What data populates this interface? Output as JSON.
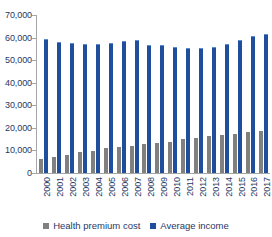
{
  "chart_data": {
    "type": "bar",
    "title": "",
    "subtitle": "",
    "xlabel": "",
    "ylabel": "",
    "ylim": [
      0,
      70000
    ],
    "yticks": [
      0,
      10000,
      20000,
      30000,
      40000,
      50000,
      60000,
      70000
    ],
    "ytick_labels": [
      "0",
      "10,000",
      "20,000",
      "30,000",
      "40,000",
      "50,000",
      "60,000",
      "70,000"
    ],
    "grid": false,
    "legend_position": "bottom-center",
    "categories": [
      "2000",
      "2001",
      "2002",
      "2003",
      "2004",
      "2005",
      "2006",
      "2007",
      "2008",
      "2009",
      "2010",
      "2011",
      "2012",
      "2013",
      "2014",
      "2015",
      "2016",
      "2017"
    ],
    "series": [
      {
        "name": "Health premium cost",
        "color": "#808080",
        "values": [
          6400,
          7100,
          8000,
          9100,
          9900,
          10900,
          11500,
          12100,
          12700,
          13400,
          13800,
          15100,
          15700,
          16300,
          16800,
          17500,
          18100,
          18800
        ]
      },
      {
        "name": "Average income",
        "color": "#1f4e9c",
        "values": [
          59500,
          58100,
          57600,
          57300,
          57000,
          57800,
          58400,
          59000,
          56900,
          56500,
          55900,
          55200,
          55500,
          55800,
          57300,
          58800,
          60500,
          61500
        ]
      }
    ]
  },
  "legend": {
    "items": [
      {
        "label": "Health premium cost",
        "color": "#808080"
      },
      {
        "label": "Average income",
        "color": "#1f4e9c"
      }
    ]
  }
}
